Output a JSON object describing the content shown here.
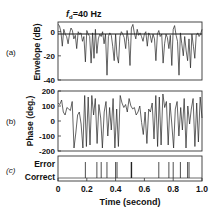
{
  "figure": {
    "title_prefix": "f",
    "title_sub": "d",
    "title_suffix": "=40 Hz",
    "panel_labels": [
      "(a)",
      "(b)",
      "(c)"
    ],
    "xlabel": "Time (second)",
    "x_ticks": [
      "0",
      "0.2",
      "0.4",
      "0.6",
      "0.8",
      "1.0"
    ]
  },
  "chart_data": [
    {
      "type": "line",
      "panel": "(a)",
      "title": "fd=40 Hz",
      "xlabel": "Time (second)",
      "ylabel": "Envelope (dB)",
      "xlim": [
        0,
        1.0
      ],
      "ylim": [
        -40,
        8
      ],
      "y_ticks": [
        0,
        -20,
        -40
      ],
      "reference_line": 0,
      "x": [
        0.0,
        0.01,
        0.02,
        0.03,
        0.04,
        0.05,
        0.06,
        0.07,
        0.08,
        0.09,
        0.1,
        0.11,
        0.12,
        0.13,
        0.14,
        0.15,
        0.16,
        0.17,
        0.18,
        0.19,
        0.2,
        0.21,
        0.22,
        0.23,
        0.24,
        0.25,
        0.26,
        0.27,
        0.28,
        0.29,
        0.3,
        0.31,
        0.32,
        0.33,
        0.34,
        0.35,
        0.36,
        0.37,
        0.38,
        0.39,
        0.4,
        0.41,
        0.42,
        0.43,
        0.44,
        0.45,
        0.46,
        0.47,
        0.48,
        0.49,
        0.5,
        0.51,
        0.52,
        0.53,
        0.54,
        0.55,
        0.56,
        0.57,
        0.58,
        0.59,
        0.6,
        0.61,
        0.62,
        0.63,
        0.64,
        0.65,
        0.66,
        0.67,
        0.68,
        0.69,
        0.7,
        0.71,
        0.72,
        0.73,
        0.74,
        0.75,
        0.76,
        0.77,
        0.78,
        0.79,
        0.8,
        0.81,
        0.82,
        0.83,
        0.84,
        0.85,
        0.86,
        0.87,
        0.88,
        0.89,
        0.9,
        0.91,
        0.92,
        0.93,
        0.94,
        0.95,
        0.96,
        0.97,
        0.98,
        0.99,
        1.0
      ],
      "values": [
        6,
        5,
        0,
        -12,
        2,
        -2,
        -4,
        -10,
        -2,
        3,
        1,
        -6,
        -3,
        -14,
        0,
        -2,
        -1,
        -8,
        -4,
        -25,
        1,
        -2,
        -4,
        -26,
        -1,
        -22,
        2,
        -18,
        -6,
        -2,
        -4,
        0,
        -10,
        -2,
        -36,
        -4,
        -1,
        -3,
        -12,
        -24,
        -2,
        -20,
        -26,
        -4,
        0,
        -2,
        -5,
        -14,
        1,
        -8,
        -28,
        3,
        6,
        -1,
        -6,
        2,
        -3,
        -1,
        -4,
        -8,
        -2,
        0,
        -12,
        -1,
        -3,
        -9,
        -2,
        -6,
        -24,
        -2,
        1,
        -4,
        -2,
        -26,
        -10,
        -2,
        -5,
        -14,
        -3,
        -28,
        2,
        5,
        -3,
        -8,
        -36,
        -1,
        -10,
        -20,
        -4,
        -16,
        -24,
        -6,
        -30,
        -2,
        -12,
        -22,
        -3,
        -1,
        -4,
        -2,
        2
      ],
      "series": [
        {
          "name": "Envelope",
          "color": "#222222"
        }
      ]
    },
    {
      "type": "line",
      "panel": "(b)",
      "xlabel": "Time (second)",
      "ylabel": "Phase (deg.)",
      "xlim": [
        0,
        1.0
      ],
      "ylim": [
        -200,
        200
      ],
      "y_ticks": [
        200,
        100,
        0,
        -100,
        -200
      ],
      "x": [
        0.0,
        0.01,
        0.02,
        0.03,
        0.04,
        0.05,
        0.06,
        0.07,
        0.08,
        0.09,
        0.1,
        0.11,
        0.12,
        0.13,
        0.14,
        0.15,
        0.16,
        0.17,
        0.18,
        0.19,
        0.2,
        0.21,
        0.22,
        0.23,
        0.24,
        0.25,
        0.26,
        0.27,
        0.28,
        0.29,
        0.3,
        0.31,
        0.32,
        0.33,
        0.34,
        0.35,
        0.36,
        0.37,
        0.38,
        0.39,
        0.4,
        0.41,
        0.42,
        0.43,
        0.44,
        0.45,
        0.46,
        0.47,
        0.48,
        0.49,
        0.5,
        0.51,
        0.52,
        0.53,
        0.54,
        0.55,
        0.56,
        0.57,
        0.58,
        0.59,
        0.6,
        0.61,
        0.62,
        0.63,
        0.64,
        0.65,
        0.66,
        0.67,
        0.68,
        0.69,
        0.7,
        0.71,
        0.72,
        0.73,
        0.74,
        0.75,
        0.76,
        0.77,
        0.78,
        0.79,
        0.8,
        0.81,
        0.82,
        0.83,
        0.84,
        0.85,
        0.86,
        0.87,
        0.88,
        0.89,
        0.9,
        0.91,
        0.92,
        0.93,
        0.94,
        0.95,
        0.96,
        0.97,
        0.98,
        0.99,
        1.0
      ],
      "values": [
        120,
        110,
        140,
        60,
        40,
        90,
        80,
        70,
        130,
        -180,
        -80,
        40,
        60,
        -20,
        -180,
        170,
        -170,
        160,
        -160,
        170,
        40,
        150,
        -150,
        110,
        20,
        -180,
        60,
        130,
        -100,
        90,
        -60,
        150,
        -180,
        80,
        -170,
        170,
        120,
        90,
        110,
        60,
        150,
        100,
        80,
        90,
        40,
        60,
        100,
        -10,
        -90,
        60,
        -150,
        80,
        60,
        120,
        -120,
        170,
        -170,
        160,
        -160,
        180,
        90,
        130,
        -160,
        120,
        -20,
        -180,
        80,
        130,
        -100,
        90,
        -60,
        150,
        -180,
        100,
        -20,
        80,
        150,
        -170,
        120,
        -140,
        160,
        20
      ],
      "series": [
        {
          "name": "Phase",
          "color": "#222222"
        }
      ]
    },
    {
      "type": "event",
      "panel": "(c)",
      "xlabel": "Time (second)",
      "xlim": [
        0,
        1.0
      ],
      "y_categories": [
        "Correct",
        "Error"
      ],
      "error_times": [
        0.19,
        0.27,
        0.3,
        0.34,
        0.4,
        0.41,
        0.51,
        0.7,
        0.77,
        0.8,
        0.85,
        0.9,
        0.91
      ],
      "series": [
        {
          "name": "Decision",
          "color": "#222222"
        }
      ]
    }
  ]
}
